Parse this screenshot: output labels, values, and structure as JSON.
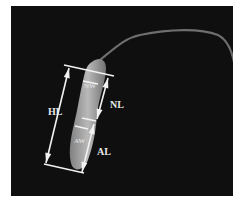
{
  "image": {
    "description": "Micrograph of a sperm cell with morphometric annotations",
    "background_color": "#0f0f0f",
    "labels": {
      "head_length": "HL",
      "nucleus_length": "NL",
      "acrosome_length": "AL",
      "nucleus_width": "NW",
      "acrosome_width": "AW"
    }
  }
}
